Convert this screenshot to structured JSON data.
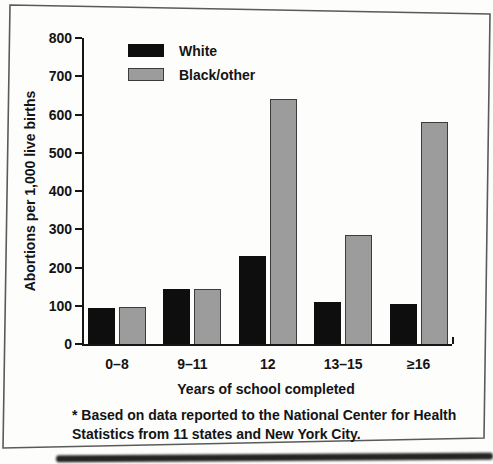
{
  "chart_data": {
    "type": "bar",
    "categories": [
      "0–8",
      "9–11",
      "12",
      "13–15",
      "≥16"
    ],
    "series": [
      {
        "name": "White",
        "color": "#0e0e0e",
        "values": [
          95,
          145,
          230,
          110,
          105
        ]
      },
      {
        "name": "Black/other",
        "color": "#9c9c9c",
        "values": [
          97,
          143,
          640,
          285,
          580
        ]
      }
    ],
    "title": "",
    "ylabel": "Abortions per 1,000 live births",
    "xlabel": "Years of school completed",
    "ylim": [
      0,
      800
    ],
    "yticks": [
      0,
      100,
      200,
      300,
      400,
      500,
      600,
      700,
      800
    ],
    "grid": false,
    "legend_position": "top-left-inside",
    "footnote_lines": [
      "* Based on data reported to the National Center for Health",
      "Statistics from 11 states and New York City."
    ],
    "colors": {
      "axis": "#161616",
      "text": "#141414",
      "frame": "#5a5a5a"
    }
  }
}
